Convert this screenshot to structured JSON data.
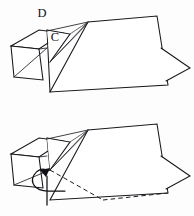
{
  "document": {
    "title": "Origami fold diagram",
    "description": "Two-step origami instruction panel: upper reference figure with labelled points, lower figure showing the fold motion."
  },
  "canvas": {
    "width": 194,
    "height": 216,
    "background_color": "#fdfdfd",
    "line_color": "#17171c"
  },
  "figures": [
    {
      "id": "step-upper",
      "name": "upper-figure",
      "labels": [
        {
          "text": "D",
          "x": 42,
          "y": 14
        },
        {
          "text": "C",
          "x": 55,
          "y": 38
        }
      ]
    },
    {
      "id": "step-lower",
      "name": "lower-figure",
      "labels": []
    }
  ],
  "annotations": {
    "valley_fold_style": "dashed",
    "motion": "rotate-flap-up-left"
  }
}
